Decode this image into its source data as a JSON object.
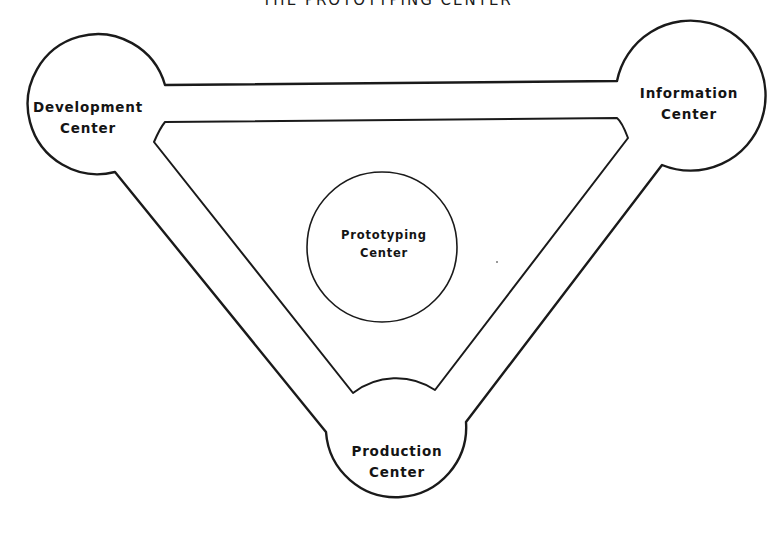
{
  "diagram": {
    "title": "THE PROTOTYPING CENTER",
    "nodes": [
      {
        "id": "development",
        "line1": "Development",
        "line2": "Center"
      },
      {
        "id": "information",
        "line1": "Information",
        "line2": "Center"
      },
      {
        "id": "prototyping",
        "line1": "Prototyping",
        "line2": "Center"
      },
      {
        "id": "production",
        "line1": "Production",
        "line2": "Center"
      }
    ],
    "edges": [
      {
        "from": "development",
        "to": "information"
      },
      {
        "from": "development",
        "to": "production"
      },
      {
        "from": "information",
        "to": "production"
      }
    ],
    "colors": {
      "stroke": "#1a1a1a",
      "background": "#ffffff"
    }
  }
}
